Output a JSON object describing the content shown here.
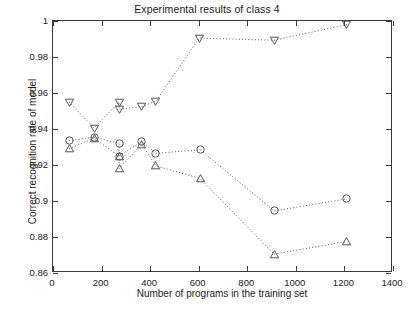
{
  "chart_data": {
    "type": "scatter",
    "title": "Experimental results of class 4",
    "xlabel": "Number of programs in the training set",
    "ylabel": "Correct recognition rate of model",
    "xlim": [
      0,
      1400
    ],
    "ylim": [
      0.86,
      1
    ],
    "xticks": [
      0,
      200,
      400,
      600,
      800,
      1000,
      1200,
      1400
    ],
    "xtick_labels": [
      "0",
      "200",
      "400",
      "600",
      "800",
      "1000",
      "1200",
      "1400"
    ],
    "yticks": [
      0.86,
      0.88,
      0.9,
      0.92,
      0.94,
      0.96,
      0.98,
      1
    ],
    "ytick_labels": [
      "0.86",
      "0.88",
      "0.9",
      "0.92",
      "0.94",
      "0.96",
      "0.98",
      "1"
    ],
    "grid": false,
    "legend": null,
    "linestyle": "dotted",
    "series": [
      {
        "name": "triangle-down-series",
        "marker": "triangle-down",
        "color": "#555555",
        "points": [
          {
            "x": 66,
            "y": 0.955
          },
          {
            "x": 169,
            "y": 0.9405
          },
          {
            "x": 272,
            "y": 0.955
          },
          {
            "x": 272,
            "y": 0.951
          },
          {
            "x": 366,
            "y": 0.9525
          },
          {
            "x": 424,
            "y": 0.9555
          },
          {
            "x": 602,
            "y": 0.9905
          },
          {
            "x": 910,
            "y": 0.9893
          },
          {
            "x": 1210,
            "y": 0.998
          }
        ]
      },
      {
        "name": "circle-series",
        "marker": "circle",
        "color": "#555555",
        "points": [
          {
            "x": 66,
            "y": 0.9335
          },
          {
            "x": 169,
            "y": 0.9355
          },
          {
            "x": 272,
            "y": 0.932
          },
          {
            "x": 272,
            "y": 0.925
          },
          {
            "x": 366,
            "y": 0.933
          },
          {
            "x": 424,
            "y": 0.9265
          },
          {
            "x": 606,
            "y": 0.9285
          },
          {
            "x": 910,
            "y": 0.8945
          },
          {
            "x": 1210,
            "y": 0.9012
          }
        ]
      },
      {
        "name": "triangle-up-series",
        "marker": "triangle-up",
        "color": "#555555",
        "points": [
          {
            "x": 66,
            "y": 0.929
          },
          {
            "x": 169,
            "y": 0.935
          },
          {
            "x": 272,
            "y": 0.9248
          },
          {
            "x": 272,
            "y": 0.918
          },
          {
            "x": 366,
            "y": 0.9315
          },
          {
            "x": 424,
            "y": 0.9195
          },
          {
            "x": 606,
            "y": 0.9125
          },
          {
            "x": 910,
            "y": 0.8705
          },
          {
            "x": 1210,
            "y": 0.8775
          }
        ]
      }
    ]
  }
}
